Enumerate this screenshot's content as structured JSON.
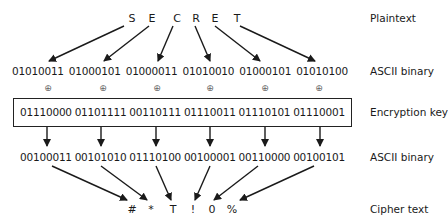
{
  "plaintext": {
    "label": "Plaintext",
    "chars": [
      "S",
      "E",
      "C",
      "R",
      "E",
      "T"
    ]
  },
  "ascii_plain": {
    "label": "ASCII binary",
    "values": [
      "01010011",
      "01000101",
      "01000011",
      "01010010",
      "01000101",
      "01010100"
    ]
  },
  "xor_symbol": "⊕",
  "key": {
    "label": "Encryption key",
    "values": [
      "01110000",
      "01101111",
      "00110111",
      "01110011",
      "01110101",
      "01110001"
    ]
  },
  "ascii_cipher": {
    "label": "ASCII binary",
    "values": [
      "00100011",
      "00101010",
      "01110100",
      "00100001",
      "00110000",
      "00100101"
    ]
  },
  "ciphertext": {
    "label": "Cipher text",
    "chars": [
      "#",
      "*",
      "T",
      "!",
      "0",
      "%"
    ]
  },
  "colors": {
    "line": "#1a1a1a",
    "background": "#ffffff"
  }
}
